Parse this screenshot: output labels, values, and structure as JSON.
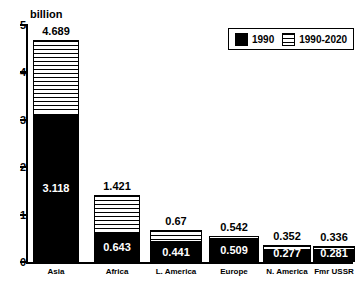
{
  "chart_data": {
    "type": "bar",
    "stacked": true,
    "title": "",
    "subtitle": "",
    "unit_caption": "billion",
    "xlabel": "",
    "ylabel": "",
    "ylim": [
      0,
      5
    ],
    "yticks": [
      0,
      1,
      2,
      3,
      4,
      5
    ],
    "ytick_labels": [
      "0",
      "1",
      "2",
      "3",
      "4",
      "5"
    ],
    "grid": false,
    "legend_position": "top-right",
    "categories": [
      "Asia",
      "Africa",
      "L. America",
      "Europe",
      "N. America",
      "Fmr USSR"
    ],
    "series": [
      {
        "name": "1990",
        "style": "solid-black",
        "color": "#000000",
        "values": [
          3.118,
          0.643,
          0.441,
          0.509,
          0.277,
          0.281
        ],
        "value_labels": [
          "3.118",
          "0.643",
          "0.441",
          "0.509",
          "0.277",
          "0.281"
        ]
      },
      {
        "name": "1990-2020",
        "style": "horizontal-hatch",
        "color": "#ffffff",
        "values": [
          1.571,
          0.778,
          0.229,
          0.033,
          0.075,
          0.055
        ],
        "value_labels": [
          "",
          "",
          "",
          "",
          "",
          ""
        ]
      }
    ],
    "totals": [
      4.689,
      1.421,
      0.67,
      0.542,
      0.352,
      0.336
    ],
    "total_labels": [
      "4.689",
      "1.421",
      "0.67",
      "0.542",
      "0.352",
      "0.336"
    ],
    "legend": [
      {
        "label": "1990",
        "style": "solid-black"
      },
      {
        "label": "1990-2020",
        "style": "horizontal-hatch"
      }
    ]
  },
  "layout": {
    "axis_left_px": 26,
    "axis_top_px": 25,
    "baseline_top_px": 262,
    "plot_height_px": 237,
    "bar_slots": [
      {
        "left": 33,
        "width": 46
      },
      {
        "left": 94,
        "width": 46
      },
      {
        "left": 150,
        "width": 52
      },
      {
        "left": 209,
        "width": 50
      },
      {
        "left": 263,
        "width": 48
      },
      {
        "left": 313,
        "width": 42
      }
    ]
  }
}
